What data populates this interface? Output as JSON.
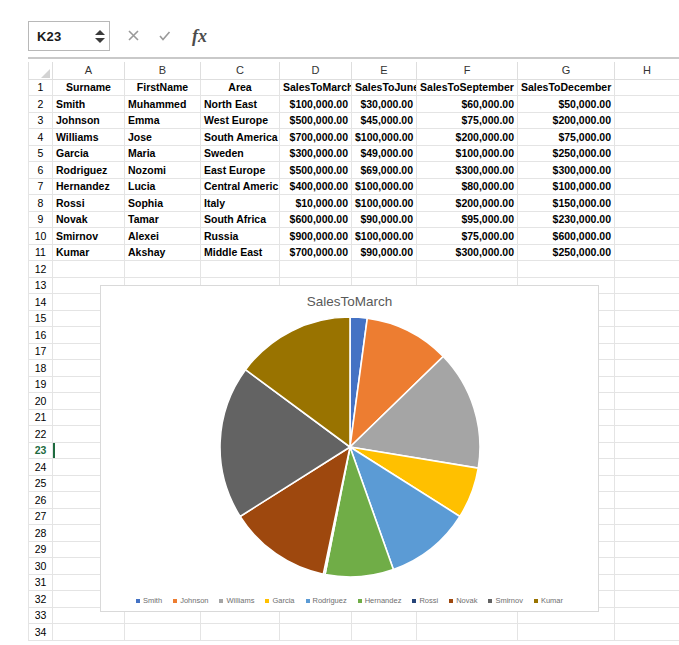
{
  "formula_bar": {
    "name_box_value": "K23",
    "cancel_icon": "close-icon",
    "confirm_icon": "check-icon",
    "fx_label": "fx",
    "formula_value": "",
    "formula_placeholder": ""
  },
  "grid": {
    "column_letters": [
      "A",
      "B",
      "C",
      "D",
      "E",
      "F",
      "G",
      "H"
    ],
    "row_numbers": [
      1,
      2,
      3,
      4,
      5,
      6,
      7,
      8,
      9,
      10,
      11,
      12,
      13,
      14,
      15,
      16,
      17,
      18,
      19,
      20,
      21,
      22,
      23,
      24,
      25,
      26,
      27,
      28,
      29,
      30,
      31,
      32,
      33,
      34
    ],
    "active_row": 23,
    "headers": [
      "Surname",
      "FirstName",
      "Area",
      "SalesToMarch",
      "SalesToJune",
      "SalesToSeptember",
      "SalesToDecember",
      ""
    ],
    "rows": [
      {
        "surname": "Smith",
        "firstname": "Muhammed",
        "area": "North East",
        "march": "$100,000.00",
        "june": "$30,000.00",
        "september": "$60,000.00",
        "december": "$50,000.00"
      },
      {
        "surname": "Johnson",
        "firstname": "Emma",
        "area": "West Europe",
        "march": "$500,000.00",
        "june": "$45,000.00",
        "september": "$75,000.00",
        "december": "$200,000.00"
      },
      {
        "surname": "Williams",
        "firstname": "Jose",
        "area": "South America",
        "march": "$700,000.00",
        "june": "$100,000.00",
        "september": "$200,000.00",
        "december": "$75,000.00"
      },
      {
        "surname": "Garcia",
        "firstname": "Maria",
        "area": "Sweden",
        "march": "$300,000.00",
        "june": "$49,000.00",
        "september": "$100,000.00",
        "december": "$250,000.00"
      },
      {
        "surname": "Rodriguez",
        "firstname": "Nozomi",
        "area": "East Europe",
        "march": "$500,000.00",
        "june": "$69,000.00",
        "september": "$300,000.00",
        "december": "$300,000.00"
      },
      {
        "surname": "Hernandez",
        "firstname": "Lucia",
        "area": "Central Americ",
        "march": "$400,000.00",
        "june": "$100,000.00",
        "september": "$80,000.00",
        "december": "$100,000.00"
      },
      {
        "surname": "Rossi",
        "firstname": "Sophia",
        "area": "Italy",
        "march": "$10,000.00",
        "june": "$100,000.00",
        "september": "$200,000.00",
        "december": "$150,000.00"
      },
      {
        "surname": "Novak",
        "firstname": "Tamar",
        "area": "South Africa",
        "march": "$600,000.00",
        "june": "$90,000.00",
        "september": "$95,000.00",
        "december": "$230,000.00"
      },
      {
        "surname": "Smirnov",
        "firstname": "Alexei",
        "area": "Russia",
        "march": "$900,000.00",
        "june": "$100,000.00",
        "september": "$75,000.00",
        "december": "$600,000.00"
      },
      {
        "surname": "Kumar",
        "firstname": "Akshay",
        "area": "Middle East",
        "march": "$700,000.00",
        "june": "$90,000.00",
        "september": "$300,000.00",
        "december": "$250,000.00"
      }
    ]
  },
  "chart_data": {
    "type": "pie",
    "title": "SalesToMarch",
    "xlabel": "",
    "ylabel": "",
    "legend_position": "bottom",
    "grid": false,
    "categories": [
      "Smith",
      "Johnson",
      "Williams",
      "Garcia",
      "Rodriguez",
      "Hernandez",
      "Rossi",
      "Novak",
      "Smirnov",
      "Kumar"
    ],
    "values": [
      100000,
      500000,
      700000,
      300000,
      500000,
      400000,
      10000,
      600000,
      900000,
      700000
    ],
    "colors": [
      "#4472C4",
      "#ED7D31",
      "#A5A5A5",
      "#FFC000",
      "#5B9BD5",
      "#70AD47",
      "#264478",
      "#9E480E",
      "#636363",
      "#997300"
    ],
    "total": 4710000
  },
  "legend": [
    {
      "label": "Smith",
      "color": "#4472C4"
    },
    {
      "label": "Johnson",
      "color": "#ED7D31"
    },
    {
      "label": "Williams",
      "color": "#A5A5A5"
    },
    {
      "label": "Garcia",
      "color": "#FFC000"
    },
    {
      "label": "Rodriguez",
      "color": "#5B9BD5"
    },
    {
      "label": "Hernandez",
      "color": "#70AD47"
    },
    {
      "label": "Rossi",
      "color": "#264478"
    },
    {
      "label": "Novak",
      "color": "#9E480E"
    },
    {
      "label": "Smirnov",
      "color": "#636363"
    },
    {
      "label": "Kumar",
      "color": "#997300"
    }
  ]
}
